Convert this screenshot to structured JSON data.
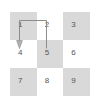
{
  "diagram": {
    "grid": {
      "rows": 3,
      "cols": 3,
      "cells": [
        {
          "label": "1",
          "shaded": true
        },
        {
          "label": "2",
          "shaded": false
        },
        {
          "label": "3",
          "shaded": true
        },
        {
          "label": "4",
          "shaded": false
        },
        {
          "label": "5",
          "shaded": true
        },
        {
          "label": "6",
          "shaded": false
        },
        {
          "label": "7",
          "shaded": true
        },
        {
          "label": "8",
          "shaded": false
        },
        {
          "label": "9",
          "shaded": true
        }
      ]
    },
    "colors": {
      "shaded_cell": "#d9d9d9",
      "plain_cell": "#ffffff",
      "label_text": "#555555",
      "arrow_stroke": "#8c8c8c",
      "background": "#ffffff"
    },
    "arrows": [
      {
        "name": "arrow-1-to-4",
        "from_cell": "1",
        "to_cell": "4",
        "direction": "down",
        "has_arrowhead": true
      },
      {
        "name": "connector-1-to-2",
        "from_cell": "1",
        "to_cell": "2",
        "direction": "right",
        "has_arrowhead": false
      },
      {
        "name": "connector-2-to-5",
        "from_cell": "2",
        "to_cell": "5",
        "direction": "down",
        "has_arrowhead": false
      }
    ]
  }
}
